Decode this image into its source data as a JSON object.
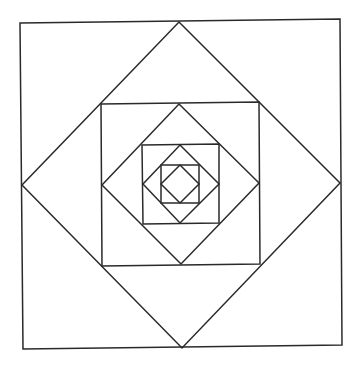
{
  "diagram": {
    "title": "",
    "stroke_color": "#2a2a2a",
    "background_color": "#ffffff",
    "shapes": [
      {
        "name": "outer-square",
        "type": "square",
        "points": [
          [
            20,
            23
          ],
          [
            340,
            19
          ],
          [
            342,
            345
          ],
          [
            23,
            349
          ]
        ]
      },
      {
        "name": "outer-diamond",
        "type": "diamond",
        "points": [
          [
            179,
            22
          ],
          [
            340,
            183
          ],
          [
            182,
            348
          ],
          [
            22,
            185
          ]
        ]
      },
      {
        "name": "second-square",
        "type": "square",
        "points": [
          [
            101,
            104
          ],
          [
            259,
            102
          ],
          [
            260,
            264
          ],
          [
            102,
            266
          ]
        ]
      },
      {
        "name": "second-diamond",
        "type": "diamond",
        "points": [
          [
            179,
            104
          ],
          [
            259,
            183
          ],
          [
            181,
            264
          ],
          [
            102,
            185
          ]
        ]
      },
      {
        "name": "third-square",
        "type": "square",
        "points": [
          [
            142,
            145
          ],
          [
            219,
            144
          ],
          [
            219,
            223
          ],
          [
            143,
            224
          ]
        ]
      },
      {
        "name": "third-diamond",
        "type": "diamond",
        "points": [
          [
            180,
            145
          ],
          [
            219,
            184
          ],
          [
            180,
            223
          ],
          [
            143,
            184
          ]
        ]
      },
      {
        "name": "fourth-square",
        "type": "square",
        "points": [
          [
            161,
            165
          ],
          [
            199,
            165
          ],
          [
            199,
            203
          ],
          [
            161,
            203
          ]
        ]
      },
      {
        "name": "inner-diamond",
        "type": "diamond",
        "points": [
          [
            180,
            165
          ],
          [
            199,
            184
          ],
          [
            180,
            203
          ],
          [
            161,
            184
          ]
        ]
      }
    ]
  }
}
